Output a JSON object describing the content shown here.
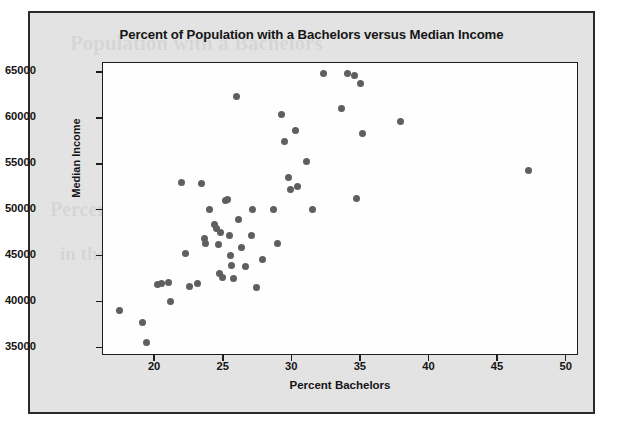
{
  "figure": {
    "title": "Percent of Population with a Bachelors versus Median Income",
    "bleed_text_1": "Population with a Bachelors",
    "bleed_text_2": "in",
    "bleed_text_3": "Percent with Bac",
    "bleed_text_4": "in the data"
  },
  "chart_data": {
    "type": "scatter",
    "title": "Percent of Population with a Bachelors versus Median Income",
    "xlabel": "Percent Bachelors",
    "ylabel": "Median Income",
    "xlim": [
      16.2,
      50.9
    ],
    "ylim": [
      34200,
      66100
    ],
    "xticks": [
      20,
      25,
      30,
      35,
      40,
      45,
      50
    ],
    "yticks": [
      35000,
      40000,
      45000,
      50000,
      55000,
      60000,
      65000
    ],
    "grid": false,
    "legend": "none",
    "marker_color": "#5f5f5f",
    "marker_size": 7,
    "points": [
      {
        "x": 17.4,
        "y": 39100
      },
      {
        "x": 19.1,
        "y": 37800
      },
      {
        "x": 19.4,
        "y": 35700
      },
      {
        "x": 20.2,
        "y": 42000
      },
      {
        "x": 20.5,
        "y": 42050
      },
      {
        "x": 21.0,
        "y": 42200
      },
      {
        "x": 21.1,
        "y": 40100
      },
      {
        "x": 21.9,
        "y": 53050
      },
      {
        "x": 22.2,
        "y": 45400
      },
      {
        "x": 22.5,
        "y": 41800
      },
      {
        "x": 23.1,
        "y": 42100
      },
      {
        "x": 23.4,
        "y": 52950
      },
      {
        "x": 23.6,
        "y": 47000
      },
      {
        "x": 23.7,
        "y": 46500
      },
      {
        "x": 24.0,
        "y": 50200
      },
      {
        "x": 24.3,
        "y": 48500
      },
      {
        "x": 24.5,
        "y": 48100
      },
      {
        "x": 24.6,
        "y": 46300
      },
      {
        "x": 24.7,
        "y": 43200
      },
      {
        "x": 24.8,
        "y": 47700
      },
      {
        "x": 24.9,
        "y": 42700
      },
      {
        "x": 25.1,
        "y": 51100
      },
      {
        "x": 25.3,
        "y": 51250
      },
      {
        "x": 25.4,
        "y": 47300
      },
      {
        "x": 25.5,
        "y": 45100
      },
      {
        "x": 25.6,
        "y": 44000
      },
      {
        "x": 25.7,
        "y": 42600
      },
      {
        "x": 25.9,
        "y": 62500
      },
      {
        "x": 26.1,
        "y": 49100
      },
      {
        "x": 26.3,
        "y": 46000
      },
      {
        "x": 26.6,
        "y": 43900
      },
      {
        "x": 27.0,
        "y": 47300
      },
      {
        "x": 27.1,
        "y": 50100
      },
      {
        "x": 27.4,
        "y": 41700
      },
      {
        "x": 27.8,
        "y": 44700
      },
      {
        "x": 28.6,
        "y": 50100
      },
      {
        "x": 28.9,
        "y": 46400
      },
      {
        "x": 29.2,
        "y": 60500
      },
      {
        "x": 29.4,
        "y": 57600
      },
      {
        "x": 29.7,
        "y": 53600
      },
      {
        "x": 29.9,
        "y": 52300
      },
      {
        "x": 30.2,
        "y": 58700
      },
      {
        "x": 30.4,
        "y": 52600
      },
      {
        "x": 31.0,
        "y": 55400
      },
      {
        "x": 31.5,
        "y": 50100
      },
      {
        "x": 32.3,
        "y": 65000
      },
      {
        "x": 33.6,
        "y": 61100
      },
      {
        "x": 34.0,
        "y": 65000
      },
      {
        "x": 34.5,
        "y": 64700
      },
      {
        "x": 34.7,
        "y": 51400
      },
      {
        "x": 35.0,
        "y": 63900
      },
      {
        "x": 35.1,
        "y": 58400
      },
      {
        "x": 37.9,
        "y": 59700
      },
      {
        "x": 47.2,
        "y": 54400
      }
    ]
  }
}
